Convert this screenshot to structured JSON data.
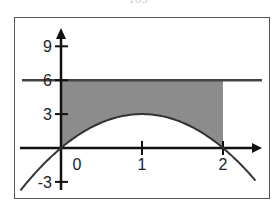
{
  "header": {
    "cut_text": "103"
  },
  "chart_data": {
    "type": "area",
    "title": "",
    "xlabel": "",
    "ylabel": "",
    "xlim": [
      -0.55,
      2.5
    ],
    "ylim": [
      -3.8,
      10.0
    ],
    "x_ticks": [
      0,
      1,
      2
    ],
    "x_tick_labels": [
      "0",
      "1",
      "2"
    ],
    "y_ticks": [
      9,
      6,
      3,
      -3
    ],
    "y_tick_labels": [
      "9",
      "6",
      "3",
      "-3"
    ],
    "grid": false,
    "legend": null,
    "series": [
      {
        "name": "curve",
        "type": "line",
        "function": "y = 6x - 3x^2",
        "x": [
          -0.5,
          0,
          0.5,
          1,
          1.5,
          2,
          2.4
        ],
        "y": [
          -3.75,
          0,
          2.25,
          3,
          2.25,
          0,
          -2.88
        ]
      },
      {
        "name": "horizontal line y=6",
        "type": "line",
        "x": [
          -0.55,
          2.5
        ],
        "y": [
          6,
          6
        ]
      }
    ],
    "shaded_region": {
      "between": [
        "y=6",
        "curve"
      ],
      "x_from": 0,
      "x_to": 2,
      "color": "#8c8c8c"
    }
  },
  "colors": {
    "frame": "#555555",
    "axis": "#111111",
    "curve": "#333333",
    "shade": "#8c8c8c",
    "hline": "#444444"
  }
}
